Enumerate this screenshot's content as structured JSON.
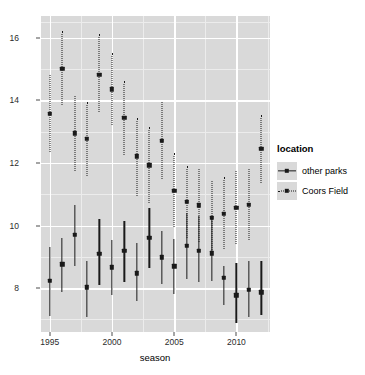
{
  "chart_data": {
    "type": "scatter",
    "title": "",
    "xlabel": "season",
    "ylabel": "runs per game (both teams combined)",
    "xlim": [
      1994.3,
      2012.7
    ],
    "ylim": [
      6.6,
      16.7
    ],
    "grid": true,
    "legend": {
      "title": "location",
      "position": "right",
      "entries": [
        {
          "label": "other parks",
          "linetype": "solid",
          "key_icon": "line-point-solid-icon"
        },
        {
          "label": "Coors Field",
          "linetype": "dotted",
          "key_icon": "line-point-dotted-icon"
        }
      ]
    },
    "x_ticks": [
      1995,
      2000,
      2005,
      2010
    ],
    "x_tick_labels": [
      "1995",
      "2000",
      "2005",
      "2010"
    ],
    "y_ticks": [
      8,
      10,
      12,
      14,
      16
    ],
    "y_tick_labels": [
      "8",
      "10",
      "12",
      "14",
      "16"
    ],
    "y_minor_ticks": [
      7,
      9,
      11,
      13,
      15,
      16.5
    ],
    "x_minor_ticks": [
      1997.5,
      2002.5,
      2007.5,
      2012.5
    ],
    "categories": [
      1995,
      1996,
      1997,
      1998,
      1999,
      2000,
      2001,
      2002,
      2003,
      2004,
      2005,
      2006,
      2007,
      2008,
      2009,
      2010,
      2011,
      2012
    ],
    "series": [
      {
        "name": "Coors Field",
        "linetype": "dotted",
        "x": [
          1995,
          1996,
          1997,
          1998,
          1999,
          2000,
          2001,
          2002,
          2003,
          2004,
          2005,
          2006,
          2007,
          2008,
          2009,
          2010,
          2011,
          2012
        ],
        "values": [
          13.58,
          15.02,
          12.95,
          12.77,
          14.82,
          14.36,
          13.45,
          12.21,
          11.93,
          12.71,
          11.12,
          10.76,
          10.65,
          10.25,
          10.38,
          10.57,
          10.67,
          12.45
        ],
        "ymin": [
          12.35,
          13.85,
          11.75,
          11.6,
          13.63,
          13.2,
          12.27,
          10.96,
          10.73,
          11.5,
          9.95,
          9.6,
          9.49,
          9.08,
          9.24,
          9.4,
          9.55,
          11.37
        ],
        "ymax": [
          14.8,
          16.22,
          14.13,
          13.95,
          16.12,
          15.53,
          14.63,
          13.44,
          13.15,
          13.94,
          12.31,
          11.92,
          11.8,
          11.44,
          11.54,
          11.74,
          11.8,
          13.55
        ]
      },
      {
        "name": "other parks",
        "linetype": "solid",
        "x": [
          1995,
          1996,
          1997,
          1998,
          1999,
          2000,
          2001,
          2002,
          2003,
          2004,
          2005,
          2006,
          2007,
          2008,
          2009,
          2010,
          2011,
          2012
        ],
        "values": [
          8.23,
          8.76,
          9.7,
          8.03,
          9.09,
          8.67,
          9.19,
          8.47,
          9.62,
          8.99,
          8.7,
          9.36,
          9.19,
          9.12,
          8.34,
          7.77,
          7.94,
          7.87
        ],
        "ymin": [
          7.12,
          7.88,
          8.72,
          7.07,
          8.1,
          7.78,
          8.19,
          7.58,
          8.66,
          8.13,
          7.82,
          8.3,
          8.2,
          8.23,
          7.46,
          6.9,
          7.08,
          7.13
        ],
        "ymax": [
          9.33,
          9.6,
          10.67,
          8.87,
          10.2,
          9.55,
          10.16,
          9.43,
          10.56,
          9.84,
          9.57,
          10.41,
          10.3,
          10.26,
          8.72,
          8.79,
          8.87,
          8.86
        ]
      }
    ]
  }
}
